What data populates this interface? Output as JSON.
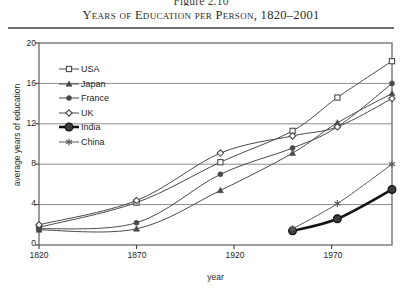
{
  "figure": {
    "number_label": "Figure 2.10",
    "title": "Years of Education per Person, 1820–2001"
  },
  "chart_data": {
    "type": "line",
    "title": "Years of Education per Person, 1820–2001",
    "subtitle": "Figure 2.10",
    "xlabel": "year",
    "ylabel": "average years of education",
    "xlim": [
      1820,
      2001
    ],
    "ylim": [
      0,
      20
    ],
    "xticks": [
      1820,
      1870,
      1920,
      1970
    ],
    "yticks": [
      0,
      4,
      8,
      12,
      16,
      20
    ],
    "grid": "horizontal",
    "legend_position": "upper-left-inside",
    "series": [
      {
        "name": "USA",
        "marker": "open-square",
        "color": "#4a4a4a",
        "x": [
          1820,
          1870,
          1913,
          1950,
          1973,
          2001
        ],
        "values": [
          1.75,
          4.2,
          8.2,
          11.3,
          14.6,
          18.2
        ]
      },
      {
        "name": "Japan",
        "marker": "filled-triangle",
        "color": "#4a4a4a",
        "x": [
          1820,
          1870,
          1913,
          1950,
          1973,
          2001
        ],
        "values": [
          1.5,
          1.6,
          5.4,
          9.1,
          12.1,
          15.0
        ]
      },
      {
        "name": "France",
        "marker": "filled-circle",
        "color": "#4a4a4a",
        "x": [
          1820,
          1870,
          1913,
          1950,
          1973,
          2001
        ],
        "values": [
          1.6,
          2.2,
          7.0,
          9.6,
          11.7,
          16.0
        ]
      },
      {
        "name": "UK",
        "marker": "open-diamond",
        "color": "#4a4a4a",
        "x": [
          1820,
          1870,
          1913,
          1950,
          1973,
          2001
        ],
        "values": [
          2.0,
          4.4,
          9.1,
          10.8,
          11.7,
          14.5
        ]
      },
      {
        "name": "India",
        "marker": "filled-circle-bold",
        "color": "#121212",
        "x": [
          1950,
          1973,
          2001
        ],
        "values": [
          1.4,
          2.6,
          5.5
        ]
      },
      {
        "name": "China",
        "marker": "asterisk",
        "color": "#5a5a5a",
        "x": [
          1950,
          1973,
          2001
        ],
        "values": [
          1.6,
          4.1,
          8.0
        ]
      }
    ]
  },
  "legend": {
    "items": [
      {
        "label": "USA"
      },
      {
        "label": "Japan"
      },
      {
        "label": "France"
      },
      {
        "label": "UK"
      },
      {
        "label": "India"
      },
      {
        "label": "China"
      }
    ]
  },
  "axes": {
    "y": {
      "label": "average years of education",
      "ticks": [
        "20",
        "16",
        "12",
        "8",
        "4",
        "0"
      ]
    },
    "x": {
      "label": "year",
      "ticks": [
        "1820",
        "1870",
        "1920",
        "1970"
      ]
    }
  }
}
